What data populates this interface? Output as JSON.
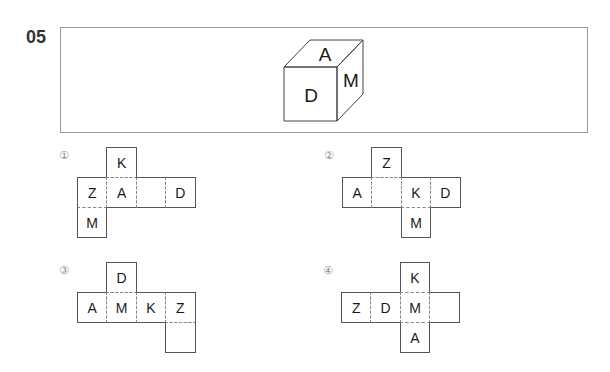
{
  "question": {
    "number": "05",
    "cube": {
      "front": "D",
      "top": "A",
      "right": "M"
    }
  },
  "options": [
    {
      "label": "①",
      "cells": [
        {
          "col": 1,
          "row": 0,
          "letter": "K"
        },
        {
          "col": 0,
          "row": 1,
          "letter": "Z"
        },
        {
          "col": 1,
          "row": 1,
          "letter": "A"
        },
        {
          "col": 2,
          "row": 1,
          "letter": ""
        },
        {
          "col": 3,
          "row": 1,
          "letter": "D"
        },
        {
          "col": 0,
          "row": 2,
          "letter": "M"
        }
      ]
    },
    {
      "label": "②",
      "cells": [
        {
          "col": 1,
          "row": 0,
          "letter": "Z"
        },
        {
          "col": 0,
          "row": 1,
          "letter": "A"
        },
        {
          "col": 1,
          "row": 1,
          "letter": ""
        },
        {
          "col": 2,
          "row": 1,
          "letter": "K"
        },
        {
          "col": 3,
          "row": 1,
          "letter": "D"
        },
        {
          "col": 2,
          "row": 2,
          "letter": "M"
        }
      ]
    },
    {
      "label": "③",
      "cells": [
        {
          "col": 1,
          "row": 0,
          "letter": "D"
        },
        {
          "col": 0,
          "row": 1,
          "letter": "A"
        },
        {
          "col": 1,
          "row": 1,
          "letter": "M"
        },
        {
          "col": 2,
          "row": 1,
          "letter": "K"
        },
        {
          "col": 3,
          "row": 1,
          "letter": "Z"
        },
        {
          "col": 3,
          "row": 2,
          "letter": ""
        }
      ]
    },
    {
      "label": "④",
      "cells": [
        {
          "col": 2,
          "row": 0,
          "letter": "K"
        },
        {
          "col": 0,
          "row": 1,
          "letter": "Z"
        },
        {
          "col": 1,
          "row": 1,
          "letter": "D"
        },
        {
          "col": 2,
          "row": 1,
          "letter": "M"
        },
        {
          "col": 3,
          "row": 1,
          "letter": ""
        },
        {
          "col": 2,
          "row": 2,
          "letter": "A"
        }
      ]
    }
  ],
  "style": {
    "line_color": "#555555",
    "fold_color": "#888888",
    "frame_color": "#9a9a9a"
  }
}
